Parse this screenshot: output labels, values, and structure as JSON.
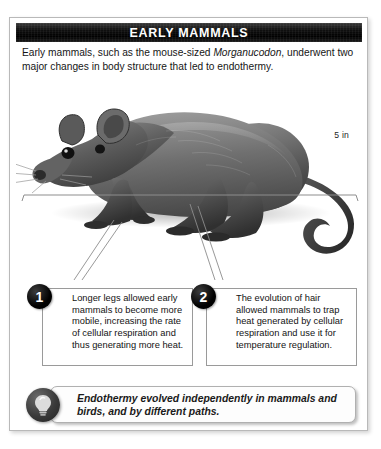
{
  "panel": {
    "title": "EARLY MAMMALS",
    "intro": {
      "before": "Early mammals, such as the mouse-sized ",
      "genus": "Morganucodon",
      "after": ", underwent two major changes in body structure that led to endothermy."
    }
  },
  "illustration": {
    "subject_name": "morganucodon-illustration",
    "scale_label": "5 in"
  },
  "callouts": [
    {
      "number": "1",
      "text": "Longer legs allowed early mammals to become more mobile, increasing the rate of cellular respiration and thus generating more heat."
    },
    {
      "number": "2",
      "text": "The evolution of hair allowed mammals to trap heat generated by cellular respiration and use it for temperature regulation."
    }
  ],
  "summary": {
    "icon": "lightbulb-icon",
    "text": "Endothermy evolved independently in mammals and birds, and by different paths."
  },
  "colors": {
    "title_bar": "#000000",
    "title_text": "#ffffff",
    "badge": "#000000",
    "body_text": "#161616",
    "border": "#9a9a9a",
    "bulb_circle": "#3a3a3a",
    "bulb_glass": "#d8d8d8"
  }
}
